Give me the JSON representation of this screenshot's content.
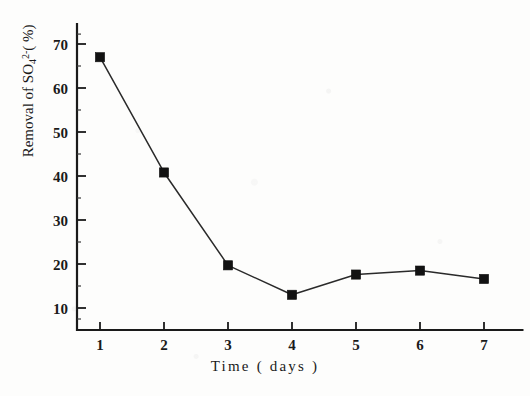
{
  "chart_data": {
    "type": "line",
    "title": "",
    "subtitle": "",
    "xlabel": "Time ( days )",
    "ylabel_parts": {
      "prefix": "Removal of SO",
      "subscript": "4",
      "superscript": "2-",
      "suffix": "( %)"
    },
    "ylabel": "Removal of SO4 2-( %)",
    "x": [
      1,
      2,
      3,
      4,
      5,
      6,
      7
    ],
    "categories": [
      "1",
      "2",
      "3",
      "4",
      "5",
      "6",
      "7"
    ],
    "values": [
      67.0,
      40.8,
      19.7,
      13.0,
      17.6,
      18.5,
      16.6
    ],
    "series": [
      {
        "name": "Removal of SO4 2- (%)",
        "values": [
          67.0,
          40.8,
          19.7,
          13.0,
          17.6,
          18.5,
          16.6
        ],
        "marker": "filled-square",
        "marker_color": "#121212",
        "line_color": "#2a2a2a"
      }
    ],
    "xlim": [
      0.45,
      7.6
    ],
    "ylim": [
      5.0,
      74.5
    ],
    "xticks": [
      1,
      2,
      3,
      4,
      5,
      6,
      7
    ],
    "xtick_labels": [
      "1",
      "2",
      "3",
      "4",
      "5",
      "6",
      "7"
    ],
    "yticks": [
      10,
      20,
      30,
      40,
      50,
      60,
      70
    ],
    "ytick_labels": [
      "10",
      "20",
      "30",
      "40",
      "50",
      "60",
      "70"
    ],
    "grid": false,
    "legend": false,
    "legend_position": "none",
    "axis_style": "left-and-bottom-spines",
    "background_color": "#fdfdfc",
    "foreground_color": "#1a1a1a"
  }
}
